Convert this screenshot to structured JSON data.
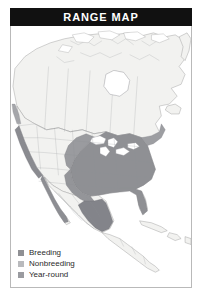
{
  "header": {
    "title": "RANGE MAP"
  },
  "map": {
    "region": "North America",
    "style": "grayscale political map with state and province boundaries",
    "water_color": "#ffffff",
    "land_color": "#f2f2f0",
    "border_color": "#9a9a9a",
    "range_fill": "#8f9094",
    "range_fill_light": "#b9babd",
    "range_fill_dark": "#77787c",
    "lakes_color": "#ffffff"
  },
  "legend": {
    "items": [
      {
        "label": "Breeding",
        "swatch_color": "#8f9094",
        "icon": "square-swatch-icon"
      },
      {
        "label": "Nonbreeding",
        "swatch_color": "#b9babd",
        "icon": "square-swatch-icon"
      },
      {
        "label": "Year-round",
        "swatch_color": "#9a9ba0",
        "icon": "square-swatch-icon"
      }
    ]
  },
  "frame": {
    "background": "#ffffff",
    "border_color": "#b9b9b9",
    "titlebar_color": "#111111",
    "titlebar_text_color": "#ffffff"
  }
}
